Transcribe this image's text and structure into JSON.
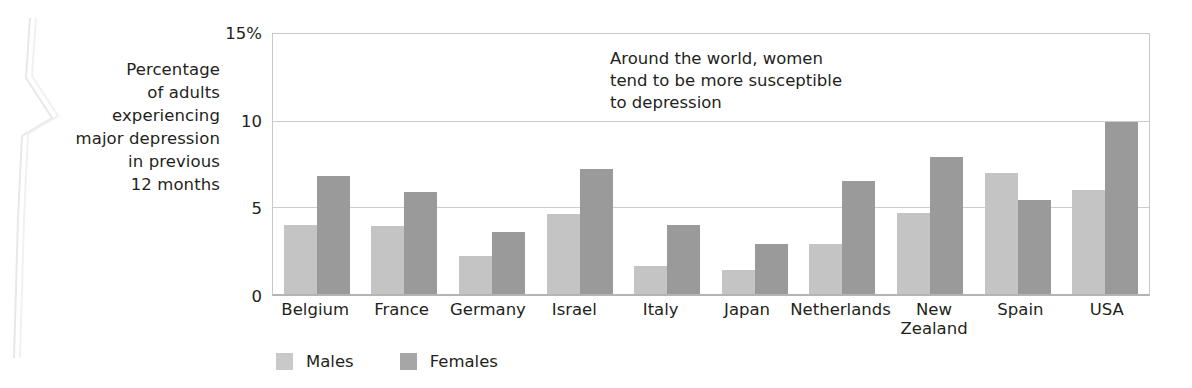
{
  "chart_data": {
    "type": "bar",
    "title": "",
    "xlabel": "",
    "ylabel": "Percentage of adults experiencing major depression in previous 12 months",
    "ylabel_lines": [
      "Percentage",
      "of adults",
      "experiencing",
      "major depression",
      "in previous",
      "12 months"
    ],
    "categories": [
      "Belgium",
      "France",
      "Germany",
      "Israel",
      "Italy",
      "Japan",
      "Netherlands",
      "New Zealand",
      "Spain",
      "USA"
    ],
    "series": [
      {
        "name": "Males",
        "color": "#c4c4c4",
        "values": [
          4.0,
          3.9,
          2.2,
          4.6,
          1.6,
          1.4,
          2.9,
          4.7,
          7.0,
          6.0
        ]
      },
      {
        "name": "Females",
        "color": "#9a9a9a",
        "values": [
          6.8,
          5.9,
          3.6,
          7.2,
          4.0,
          2.9,
          6.5,
          7.9,
          5.4,
          9.9
        ]
      }
    ],
    "ylim": [
      0,
      15
    ],
    "yticks": [
      0,
      5,
      10,
      15
    ],
    "ytick_labels": [
      "0",
      "5",
      "10",
      "15%"
    ],
    "grid": true,
    "legend_position": "bottom-left",
    "annotations": [
      {
        "text": "Around the world, women\ntend to be more susceptible\nto depression"
      }
    ]
  }
}
